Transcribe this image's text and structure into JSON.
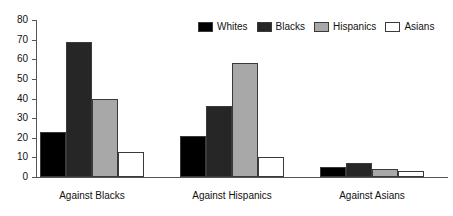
{
  "chart_data": {
    "type": "bar",
    "title": "",
    "subtitle": "",
    "xlabel": "",
    "ylabel": "",
    "ylim": [
      0,
      80
    ],
    "ytick_step": 10,
    "yticks": [
      0,
      10,
      20,
      30,
      40,
      50,
      60,
      70,
      80
    ],
    "ytick_labels": [
      "0",
      "10",
      "20",
      "30",
      "40",
      "50",
      "60",
      "70",
      "80"
    ],
    "grid": false,
    "legend_position": "top-right",
    "categories": [
      "Against Blacks",
      "Against Hispanics",
      "Against Asians"
    ],
    "series": [
      {
        "name": "Whites",
        "color": "#000000",
        "values": [
          23,
          21,
          5
        ]
      },
      {
        "name": "Blacks",
        "color": "#262626",
        "values": [
          69,
          36,
          7
        ]
      },
      {
        "name": "Hispanics",
        "color": "#a8a8a8",
        "values": [
          40,
          58,
          4
        ]
      },
      {
        "name": "Asians",
        "color": "#ffffff",
        "values": [
          13,
          10,
          3
        ]
      }
    ]
  },
  "legend": {
    "entries": [
      {
        "label": "Whites"
      },
      {
        "label": "Blacks"
      },
      {
        "label": "Hispanics"
      },
      {
        "label": "Asians"
      }
    ]
  },
  "colors": {
    "whites": "#000000",
    "blacks": "#262626",
    "hispanics": "#a8a8a8",
    "asians": "#ffffff",
    "outline": "#3a3a3a",
    "axis": "#555555",
    "text": "#111111",
    "background": "#ffffff"
  }
}
